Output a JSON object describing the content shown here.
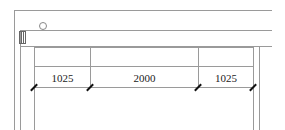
{
  "drawing": {
    "dimensions": [
      {
        "label": "1025"
      },
      {
        "label": "2000"
      },
      {
        "label": "1025"
      }
    ],
    "line_color": "#9a9a9a",
    "tick_color": "#111111"
  }
}
